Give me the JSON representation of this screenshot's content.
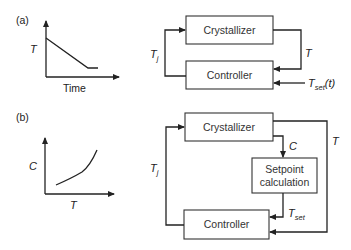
{
  "panel_a": {
    "label": "(a)",
    "graph": {
      "y_label": "T",
      "x_label": "Time"
    },
    "blocks": {
      "crystallizer": "Crystallizer",
      "controller": "Controller"
    },
    "signals": {
      "jacket_temp_main": "T",
      "jacket_temp_sub": "j",
      "measured_temp": "T",
      "setpoint_main": "T",
      "setpoint_sub": "set",
      "setpoint_arg": "(t)"
    }
  },
  "panel_b": {
    "label": "(b)",
    "graph": {
      "y_label": "C",
      "x_label": "T"
    },
    "blocks": {
      "crystallizer": "Crystallizer",
      "setpoint_line1": "Setpoint",
      "setpoint_line2": "calculation",
      "controller": "Controller"
    },
    "signals": {
      "concentration": "C",
      "measured_temp": "T",
      "jacket_temp_main": "T",
      "jacket_temp_sub": "j",
      "setpoint_main": "T",
      "setpoint_sub": "set"
    }
  },
  "colors": {
    "line": "#222222",
    "box_border": "#333333",
    "background": "#ffffff"
  }
}
